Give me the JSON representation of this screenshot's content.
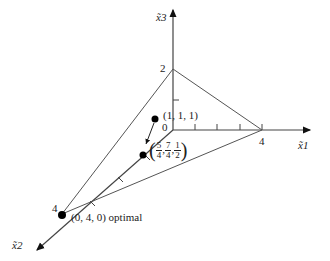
{
  "diagram": {
    "axes": {
      "x1": {
        "label": "x̃1",
        "tick_label": "4"
      },
      "x2": {
        "label": "x̃2",
        "tick_label": "4"
      },
      "x3": {
        "label": "x̃3",
        "tick_label": "2"
      },
      "origin_label": "0"
    },
    "points": [
      {
        "label": "(1, 1, 1)"
      },
      {
        "label_fracs": [
          [
            "5",
            "4"
          ],
          [
            "7",
            "4"
          ],
          [
            "1",
            "2"
          ]
        ]
      },
      {
        "label": "(0, 4, 0) optimal"
      }
    ],
    "colors": {
      "line": "#555555",
      "axis": "#222222",
      "point": "#000000"
    }
  }
}
